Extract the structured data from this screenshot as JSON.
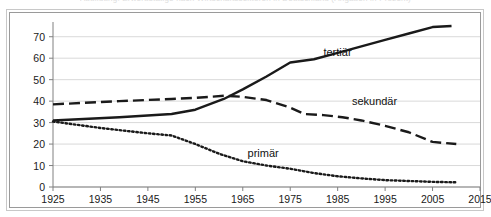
{
  "figure": {
    "cropped_caption_sliver": "Abbildung: Erwerbstätige nach Wirtschaftssektoren in Deutschland (Angaben in Prozent)",
    "background_color": "#ffffff",
    "frame_outer_color": "#c8c8c8",
    "frame_inner_color": "#9a9a9a",
    "gridline_color": "#d9d9d9",
    "axis_color": "#808080",
    "series_color": "#1a1a1a"
  },
  "chart_data": {
    "type": "line",
    "title": "",
    "xlabel": "",
    "ylabel": "",
    "xlim": [
      1925,
      2015
    ],
    "ylim": [
      0,
      75
    ],
    "grid": true,
    "legend_position": "inline-annotations",
    "x_ticks": [
      1925,
      1935,
      1945,
      1955,
      1965,
      1975,
      1985,
      1995,
      2005,
      2015
    ],
    "y_ticks": [
      0,
      10,
      20,
      30,
      40,
      50,
      60,
      70
    ],
    "series": [
      {
        "name": "tertiär",
        "style": "solid",
        "label_x": 1982,
        "label_y": 61,
        "x": [
          1925,
          1939,
          1950,
          1955,
          1961,
          1965,
          1970,
          1975,
          1980,
          1985,
          1990,
          1995,
          2000,
          2005,
          2009
        ],
        "values": [
          31,
          32.5,
          34,
          36,
          41,
          45.5,
          51.5,
          58,
          59.5,
          62.5,
          65.5,
          68.5,
          71.5,
          74.5,
          75
        ]
      },
      {
        "name": "sekundär",
        "style": "dashed",
        "label_x": 1988,
        "label_y": 38,
        "x": [
          1925,
          1939,
          1950,
          1955,
          1961,
          1965,
          1970,
          1975,
          1978,
          1982,
          1986,
          1990,
          1995,
          2000,
          2005,
          2010
        ],
        "values": [
          38.5,
          40,
          41,
          41.5,
          42.5,
          42,
          40.5,
          37,
          34,
          33.5,
          32.5,
          31,
          28.5,
          25.5,
          21,
          20
        ]
      },
      {
        "name": "primär",
        "style": "dotted",
        "label_x": 1966,
        "label_y": 14,
        "x": [
          1925,
          1935,
          1945,
          1950,
          1955,
          1960,
          1965,
          1970,
          1975,
          1980,
          1985,
          1990,
          1995,
          2000,
          2005,
          2010
        ],
        "values": [
          30.5,
          27.5,
          25,
          24,
          20,
          15.5,
          12,
          10,
          8.5,
          6.5,
          5,
          4,
          3.2,
          2.8,
          2.4,
          2.2
        ]
      }
    ]
  }
}
